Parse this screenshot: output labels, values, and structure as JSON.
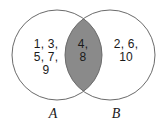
{
  "diagram": {
    "type": "venn-diagram",
    "background_color": "#ffffff",
    "stroke_color": "#6b6b6b",
    "intersection_fill_color": "#8a8a8a",
    "text_color": "#1a1a1a",
    "sets": {
      "a": {
        "label": "A",
        "elements_text": "1, 3,\n5, 7,\n9",
        "elements": [
          1,
          3,
          5,
          7,
          9
        ],
        "center_x": 57,
        "center_y": 55,
        "radius": 45
      },
      "b": {
        "label": "B",
        "elements_text": "2, 6,\n10",
        "elements": [
          2,
          6,
          10
        ],
        "center_x": 110,
        "center_y": 55,
        "radius": 45
      }
    },
    "intersection": {
      "elements_text": "4,\n8",
      "elements": [
        4,
        8
      ],
      "shaded": true
    }
  }
}
